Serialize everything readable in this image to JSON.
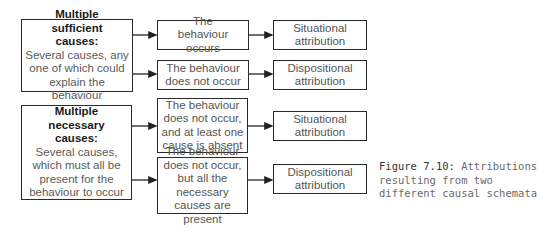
{
  "schema_sufficient": {
    "title": "Multiple sufficient causes:",
    "description": "Several causes, any one of which could explain the behaviour",
    "outcomes": [
      {
        "condition": "The behaviour occurs",
        "attribution": "Situational attribution"
      },
      {
        "condition": "The behaviour does not occur",
        "attribution": "Dispositional attribution"
      }
    ]
  },
  "schema_necessary": {
    "title": "Multiple necessary causes:",
    "description": "Several causes, which must all be present for the behaviour to occur",
    "outcomes": [
      {
        "condition": "The behaviour does not occur, and at least one cause is absent",
        "attribution": "Situational attribution"
      },
      {
        "condition": "The behaviour does not occur, but all the necessary causes are present",
        "attribution": "Dispositional attribution"
      }
    ]
  },
  "caption": {
    "label": "Figure 7.10:",
    "text": "Attributions resulting from two different causal schemata"
  },
  "colors": {
    "border": "#2a2a2a",
    "text": "#555555",
    "title": "#1a1a1a"
  }
}
